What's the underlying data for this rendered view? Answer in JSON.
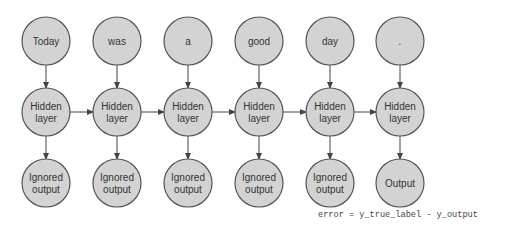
{
  "diagram": {
    "inputs": [
      "Today",
      "was",
      "a",
      "good",
      "day",
      "."
    ],
    "hidden": [
      [
        "Hidden",
        "layer"
      ],
      [
        "Hidden",
        "layer"
      ],
      [
        "Hidden",
        "layer"
      ],
      [
        "Hidden",
        "layer"
      ],
      [
        "Hidden",
        "layer"
      ],
      [
        "Hidden",
        "layer"
      ]
    ],
    "outputs": [
      [
        "Ignored",
        "output"
      ],
      [
        "Ignored",
        "output"
      ],
      [
        "Ignored",
        "output"
      ],
      [
        "Ignored",
        "output"
      ],
      [
        "Ignored",
        "output"
      ],
      [
        "Output"
      ]
    ],
    "formula": "error = y_true_label - y_output",
    "colors": {
      "node_fill": "#d3d3d3",
      "node_stroke": "#555555",
      "edge": "#444444"
    }
  }
}
